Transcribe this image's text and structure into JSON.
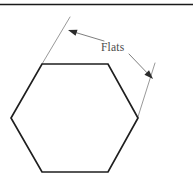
{
  "figure": {
    "name": "hexagon-flats-dimension-diagram",
    "background_color": "#ffffff",
    "width": 193,
    "height": 184,
    "top_rule": {
      "name": "top-horizontal-rule",
      "color": "#1a1a1a",
      "y": 4.5,
      "x_start": 0,
      "x_end": 193,
      "thickness": 1.6
    },
    "shape": {
      "name": "hexagon",
      "type": "regular-hexagon-flat-top",
      "stroke_color": "#1f1f1f",
      "fill_color": "#ffffff",
      "stroke_width": 1.7,
      "vertices": [
        {
          "x": 42,
          "y": 64
        },
        {
          "x": 108,
          "y": 64
        },
        {
          "x": 138,
          "y": 118
        },
        {
          "x": 108,
          "y": 172
        },
        {
          "x": 42,
          "y": 172
        },
        {
          "x": 11,
          "y": 118
        }
      ],
      "points_string": "42,64 108,64 138,118 108,172 42,172 11,118"
    },
    "extension_lines": {
      "color": "#8d8d8d",
      "thickness": 0.9,
      "left": {
        "name": "left-extension-line",
        "x1": 42,
        "y1": 64,
        "x2": 70,
        "y2": 17
      },
      "right": {
        "name": "right-extension-line",
        "x1": 155,
        "y1": 63,
        "x2": 137,
        "y2": 120
      }
    },
    "leaders": {
      "color": "#6f6f6f",
      "thickness": 0.9,
      "upper_left": {
        "name": "leader-line-upper-left",
        "x1": 104,
        "y1": 41,
        "x2": 70,
        "y2": 30,
        "arrow_angle_deg": 198
      },
      "lower_right": {
        "name": "leader-line-lower-right",
        "x1": 129,
        "y1": 54,
        "x2": 152,
        "y2": 78,
        "arrow_angle_deg": 46
      }
    },
    "arrowheads": {
      "color": "#2b2b2b",
      "length": 9,
      "half_width": 3.2,
      "upper_left": {
        "name": "arrowhead-upper-left",
        "tip_x": 68,
        "tip_y": 30
      },
      "lower_right": {
        "name": "arrowhead-lower-right",
        "tip_x": 153,
        "tip_y": 79
      }
    },
    "labels": {
      "flats": {
        "name": "flats-dimension-label",
        "text": "Flats",
        "x": 101,
        "y": 51,
        "color": "#4a4a4a",
        "font_size": 11.5
      }
    }
  }
}
